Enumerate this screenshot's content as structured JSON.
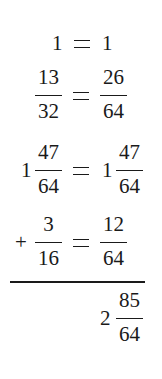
{
  "rows": [
    {
      "left": {
        "whole": "1"
      },
      "operator": "=",
      "right": {
        "whole": "1"
      }
    },
    {
      "left": {
        "numerator": "13",
        "denominator": "32"
      },
      "operator": "=",
      "right": {
        "numerator": "26",
        "denominator": "64"
      }
    },
    {
      "left": {
        "whole": "1",
        "numerator": "47",
        "denominator": "64"
      },
      "operator": "=",
      "right": {
        "whole": "1",
        "numerator": "47",
        "denominator": "64"
      }
    },
    {
      "prefix": "+",
      "left": {
        "numerator": "3",
        "denominator": "16"
      },
      "operator": "=",
      "right": {
        "numerator": "12",
        "denominator": "64"
      }
    }
  ],
  "result": {
    "whole": "2",
    "numerator": "85",
    "denominator": "64"
  }
}
